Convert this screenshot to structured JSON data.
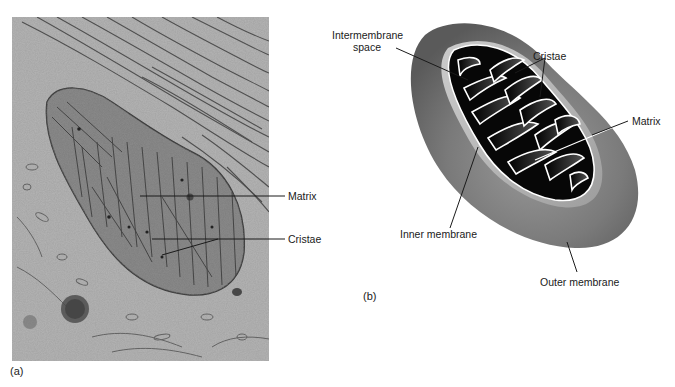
{
  "figure": {
    "panels": [
      {
        "id": "a",
        "panel_label": "(a)",
        "kind": "electron micrograph",
        "labels": [
          {
            "text": "Matrix"
          },
          {
            "text": "Cristae"
          }
        ]
      },
      {
        "id": "b",
        "panel_label": "(b)",
        "kind": "cutaway illustration",
        "labels": [
          {
            "text_line1": "Intermembrane",
            "text_line2": "space"
          },
          {
            "text": "Cristae"
          },
          {
            "text": "Matrix"
          },
          {
            "text": "Inner membrane"
          },
          {
            "text": "Outer membrane"
          }
        ]
      }
    ]
  },
  "colors": {
    "background": "#ffffff",
    "micrograph_base": "#9a9a9a",
    "outer_membrane": "#6e6e6e",
    "intermembrane_light": "#bdbdbd",
    "matrix_dark": "#0a0a0a",
    "cristae_outline": "#ffffff",
    "leader_line": "#1a1a1a"
  }
}
